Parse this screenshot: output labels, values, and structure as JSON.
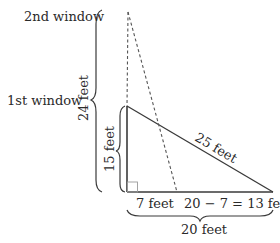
{
  "diagram": {
    "labels": {
      "second_window": "2nd window",
      "first_window": "1st window",
      "total_height": "24 feet",
      "first_height": "15 feet",
      "hypotenuse": "25 feet",
      "base_left": "7 feet",
      "base_right": "20 − 7 = 13 feet",
      "base_total": "20 feet"
    },
    "colors": {
      "line": "#3a3a3a",
      "text": "#2a2a2a",
      "right_angle_marker": "#9a9a9a"
    }
  }
}
